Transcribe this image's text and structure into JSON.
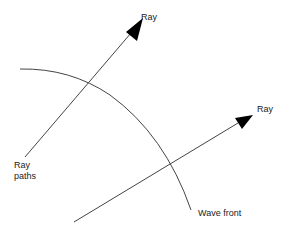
{
  "diagram": {
    "labels": {
      "ray_top": "Ray",
      "ray_right": "Ray",
      "ray_paths_line1": "Ray",
      "ray_paths_line2": "paths",
      "wave_front": "Wave front"
    },
    "colors": {
      "line": "#444444",
      "arrow": "#000000",
      "background": "#ffffff"
    }
  }
}
